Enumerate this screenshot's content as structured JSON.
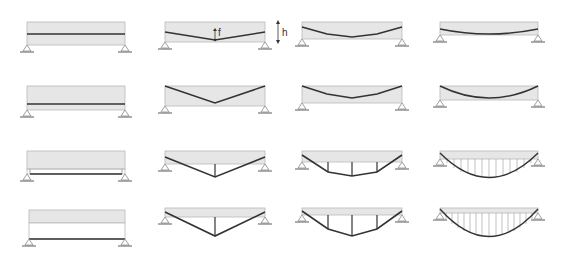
{
  "diagram": {
    "colors": {
      "beam_fill": "#e6e6e6",
      "beam_stroke": "#b8b8b8",
      "cable": "#333333",
      "hanger": "#555555",
      "support": "#888888",
      "background": "#ffffff"
    },
    "annotations": {
      "sag_label": "f",
      "depth_label": "h"
    },
    "rows": [
      {
        "id": "row-1",
        "description": "Internal tendon within beam depth",
        "cells": [
          {
            "profile": "straight",
            "label": "straight tendon"
          },
          {
            "profile": "single-point drape",
            "label": "single-point drape with sag f and depth h"
          },
          {
            "profile": "multi-point drape",
            "label": "polygonal tendon"
          },
          {
            "profile": "parabolic",
            "label": "parabolic tendon"
          }
        ]
      },
      {
        "id": "row-2",
        "description": "Internal tendon, full-depth profile",
        "cells": [
          {
            "profile": "straight",
            "label": "straight tendon near bottom"
          },
          {
            "profile": "single-point drape",
            "label": "V profile from top corners"
          },
          {
            "profile": "multi-point drape",
            "label": "polygonal profile from top corners"
          },
          {
            "profile": "parabolic",
            "label": "parabolic profile from top corners"
          }
        ]
      },
      {
        "id": "row-3",
        "description": "External tendon, shallow",
        "cells": [
          {
            "profile": "straight",
            "label": "straight external tie with end posts"
          },
          {
            "profile": "single-point drape",
            "label": "king-post truss"
          },
          {
            "profile": "multi-point drape",
            "label": "multi-post polygonal truss"
          },
          {
            "profile": "parabolic",
            "label": "parabolic cable with hangers"
          }
        ]
      },
      {
        "id": "row-4",
        "description": "External tendon, deep",
        "cells": [
          {
            "profile": "straight",
            "label": "deep straight tie with end posts"
          },
          {
            "profile": "single-point drape",
            "label": "deep king-post truss"
          },
          {
            "profile": "multi-point drape",
            "label": "deep multi-post truss"
          },
          {
            "profile": "parabolic",
            "label": "deep parabolic cable with hangers"
          }
        ]
      }
    ]
  }
}
